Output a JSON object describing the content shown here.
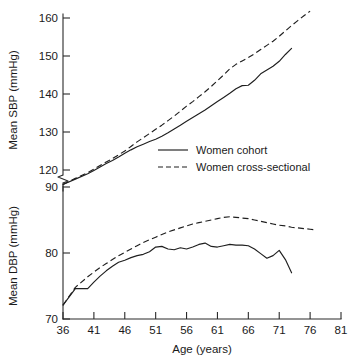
{
  "chart_data": {
    "type": "line",
    "title": "",
    "subtitle": "",
    "xlabel": "Age (years)",
    "xlim": [
      36,
      81
    ],
    "xticks": [
      36,
      41,
      46,
      51,
      56,
      61,
      66,
      71,
      76,
      81
    ],
    "xticklabels": [
      "36",
      "41",
      "46",
      "51",
      "56",
      "61",
      "66",
      "71",
      "76",
      "81"
    ],
    "grid": false,
    "legend_position": "center-right of upper panel",
    "panels": [
      {
        "name": "sbp",
        "ylabel": "Mean SBP (mmHg)",
        "ylim": [
          90,
          164
        ],
        "yticks": [
          90,
          120,
          130,
          140,
          150,
          160
        ],
        "yticklabels": [
          "90",
          "120",
          "130",
          "140",
          "150",
          "160"
        ],
        "axis_break": {
          "between": [
            90,
            120
          ],
          "style": "zigzag"
        },
        "series": [
          {
            "name": "Women cohort",
            "style": "solid",
            "x": [
              36,
              38,
              40,
              41,
              42,
              43,
              44,
              45,
              46,
              47,
              48,
              49,
              50,
              51,
              52,
              53,
              54,
              55,
              56,
              57,
              58,
              59,
              60,
              61,
              62,
              63,
              64,
              65,
              66,
              67,
              68,
              69,
              70,
              71,
              72,
              73
            ],
            "values": [
              116.2,
              117.6,
              119.0,
              119.9,
              120.8,
              121.7,
              122.5,
              123.4,
              124.4,
              125.3,
              126.1,
              126.8,
              127.5,
              128.1,
              128.9,
              129.8,
              130.8,
              131.8,
              132.8,
              133.8,
              134.8,
              135.8,
              136.9,
              138.0,
              139.1,
              140.2,
              141.4,
              142.2,
              142.3,
              143.6,
              145.3,
              146.3,
              147.3,
              148.6,
              150.4,
              152.0
            ]
          },
          {
            "name": "Women cross-sectional",
            "style": "dashed",
            "x": [
              36,
              38,
              40,
              41,
              42,
              43,
              44,
              45,
              46,
              47,
              48,
              49,
              50,
              51,
              52,
              53,
              54,
              55,
              56,
              57,
              58,
              59,
              60,
              61,
              62,
              63,
              64,
              65,
              66,
              67,
              68,
              69,
              70,
              71,
              72,
              73,
              74,
              75,
              76
            ],
            "values": [
              116.2,
              117.8,
              119.3,
              120.2,
              121.2,
              122.1,
              123.0,
              124.0,
              125.0,
              126.2,
              127.4,
              128.5,
              129.6,
              130.7,
              131.8,
              133.0,
              134.2,
              135.5,
              136.8,
              138.0,
              139.3,
              140.6,
              142.0,
              143.5,
              145.0,
              146.6,
              147.8,
              148.7,
              149.6,
              150.6,
              151.7,
              152.8,
              153.9,
              155.2,
              156.6,
              158.0,
              159.3,
              160.6,
              161.8
            ]
          }
        ]
      },
      {
        "name": "dbp",
        "ylabel": "Mean DBP (mmHg)",
        "ylim": [
          70,
          92
        ],
        "yticks": [
          70,
          80,
          90
        ],
        "yticklabels": [
          "70",
          "80",
          "90"
        ],
        "series": [
          {
            "name": "Women cohort",
            "style": "solid",
            "x": [
              36,
              38,
              39,
              40,
              41,
              42,
              43,
              44,
              45,
              46,
              47,
              48,
              49,
              50,
              51,
              52,
              53,
              54,
              55,
              56,
              57,
              58,
              59,
              60,
              61,
              62,
              63,
              64,
              65,
              66,
              67,
              68,
              69,
              70,
              71,
              72,
              73
            ],
            "values": [
              72.1,
              74.6,
              74.6,
              74.6,
              75.6,
              76.5,
              77.3,
              78.0,
              78.6,
              78.9,
              79.3,
              79.6,
              79.8,
              80.2,
              80.9,
              81.0,
              80.6,
              80.5,
              80.8,
              80.6,
              80.9,
              81.3,
              81.5,
              81.0,
              80.9,
              81.1,
              81.3,
              81.2,
              81.2,
              81.1,
              80.6,
              79.9,
              79.2,
              79.6,
              80.4,
              79.0,
              77.0
            ]
          },
          {
            "name": "Women cross-sectional",
            "style": "dashed",
            "x": [
              36,
              38,
              40,
              41,
              42,
              43,
              44,
              45,
              46,
              47,
              48,
              49,
              50,
              51,
              52,
              53,
              54,
              55,
              56,
              57,
              58,
              59,
              60,
              61,
              62,
              63,
              64,
              65,
              66,
              67,
              68,
              69,
              70,
              71,
              72,
              73,
              74,
              75,
              76,
              77
            ],
            "values": [
              72.1,
              74.8,
              76.4,
              77.1,
              77.8,
              78.4,
              79.0,
              79.6,
              80.1,
              80.6,
              81.1,
              81.6,
              82.0,
              82.4,
              82.8,
              83.2,
              83.5,
              83.8,
              84.1,
              84.4,
              84.6,
              84.8,
              85.0,
              85.2,
              85.4,
              85.5,
              85.4,
              85.3,
              85.2,
              85.0,
              84.8,
              84.6,
              84.4,
              84.2,
              84.1,
              83.9,
              83.8,
              83.7,
              83.6,
              83.5
            ]
          }
        ]
      }
    ],
    "legend": [
      {
        "label": "Women cohort",
        "style": "solid"
      },
      {
        "label": "Women cross-sectional",
        "style": "dashed"
      }
    ]
  }
}
